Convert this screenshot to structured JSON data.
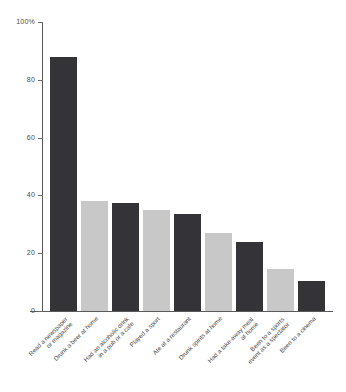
{
  "chart_data": {
    "type": "bar",
    "title": "",
    "subtitle": "",
    "xlabel": "",
    "ylabel": "",
    "ylim": [
      0,
      100
    ],
    "grid": false,
    "legend": "none",
    "unit": "%",
    "y_ticks": [
      {
        "value": 100,
        "label": "100%"
      },
      {
        "value": 80,
        "label": "80"
      },
      {
        "value": 60,
        "label": "60"
      },
      {
        "value": 40,
        "label": "40"
      },
      {
        "value": 20,
        "label": "20"
      },
      {
        "value": 0,
        "label": "0"
      }
    ],
    "categories": [
      "Read a newspaper or magazine",
      "Drunk a beer at home",
      "Had an alcoholic drink in a pub or a cafe",
      "Played a sport",
      "Ate at a restaurant",
      "Drunk spirits at home",
      "Had a take-away meal at home",
      "Been to a sports event as a spectator",
      "Been to a cinema"
    ],
    "category_lines": [
      [
        "Read a newspaper",
        "or magazine"
      ],
      [
        "Drunk a beer at home",
        ""
      ],
      [
        "Had an alcoholic drink",
        "in a pub or a cafe"
      ],
      [
        "Played a sport",
        ""
      ],
      [
        "Ate at a restaurant",
        ""
      ],
      [
        "Drunk spirits at home",
        ""
      ],
      [
        "Had a take-away meal",
        "at home"
      ],
      [
        "Been to a sports",
        "event as a spectator"
      ],
      [
        "Been to a cinema",
        ""
      ]
    ],
    "values": [
      88,
      38,
      37.5,
      35,
      33.5,
      27,
      24,
      14.5,
      10.5
    ],
    "bar_colors": [
      "#333338",
      "#c8c8c8",
      "#333338",
      "#c8c8c8",
      "#333338",
      "#c8c8c8",
      "#333338",
      "#c8c8c8",
      "#333338"
    ]
  },
  "colors": {
    "dark_bar": "#333338",
    "light_bar": "#c8c8c8",
    "axis": "#5a5a5a",
    "text": "#4a4a4a",
    "background": "#ffffff"
  }
}
